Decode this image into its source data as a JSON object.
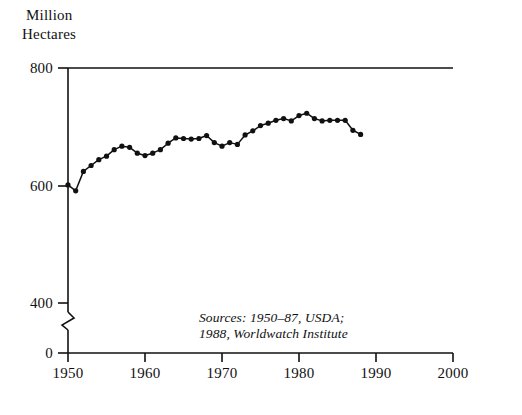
{
  "figure": {
    "y_axis_title_line1": "Million",
    "y_axis_title_line2": "Hectares",
    "y_tick_labels": [
      "800",
      "600",
      "400",
      "0"
    ],
    "x_tick_labels": [
      "1950",
      "1960",
      "1970",
      "1980",
      "1990",
      "2000"
    ],
    "source_note_line1": "Sources: 1950–87, USDA;",
    "source_note_line2": "1988, Worldwatch Institute",
    "line_color": "#111111",
    "axis_color": "#111111",
    "background_color": "#ffffff"
  },
  "chart_data": {
    "type": "line",
    "title": "",
    "subtitle": "",
    "xlabel": "",
    "ylabel": "Million Hectares",
    "xlim": [
      1950,
      2000
    ],
    "ylim": [
      400,
      800
    ],
    "y_axis_break": true,
    "y_break_between": [
      0,
      400
    ],
    "y_ticks": [
      0,
      400,
      600,
      800
    ],
    "x_ticks": [
      1950,
      1960,
      1970,
      1980,
      1990,
      2000
    ],
    "grid": false,
    "legend": false,
    "markers": "filled-circle",
    "annotations": [
      {
        "text": "Sources: 1950–87, USDA; 1988, Worldwatch Institute",
        "x": 1969,
        "y": 440,
        "style": "italic"
      }
    ],
    "x": [
      1950,
      1951,
      1952,
      1953,
      1954,
      1955,
      1956,
      1957,
      1958,
      1959,
      1960,
      1961,
      1962,
      1963,
      1964,
      1965,
      1966,
      1967,
      1968,
      1969,
      1970,
      1971,
      1972,
      1973,
      1974,
      1975,
      1976,
      1977,
      1978,
      1979,
      1980,
      1981,
      1982,
      1983,
      1984,
      1985,
      1986,
      1987,
      1988
    ],
    "values": [
      601,
      591,
      624,
      634,
      644,
      650,
      661,
      667,
      665,
      655,
      651,
      655,
      661,
      672,
      681,
      680,
      679,
      680,
      685,
      673,
      667,
      673,
      670,
      686,
      693,
      702,
      706,
      711,
      714,
      710,
      719,
      723,
      714,
      710,
      711,
      711,
      711,
      694,
      687
    ],
    "series": [
      {
        "name": "World grain harvested area",
        "values": [
          601,
          591,
          624,
          634,
          644,
          650,
          661,
          667,
          665,
          655,
          651,
          655,
          661,
          672,
          681,
          680,
          679,
          680,
          685,
          673,
          667,
          673,
          670,
          686,
          693,
          702,
          706,
          711,
          714,
          710,
          719,
          723,
          714,
          710,
          711,
          711,
          711,
          694,
          687
        ]
      }
    ]
  }
}
